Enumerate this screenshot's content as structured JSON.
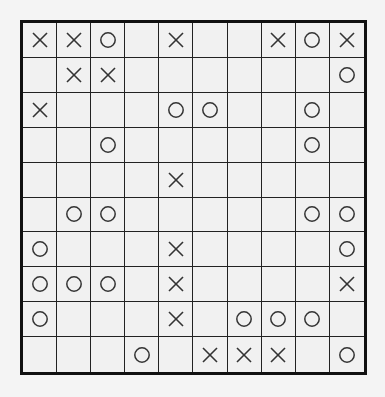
{
  "puzzle": {
    "rows": 10,
    "cols": 10,
    "colors": {
      "background": "#f4f4f4",
      "cell": "#f1f1f1",
      "line": "#222222",
      "border": "#111111",
      "mark": "#333333"
    },
    "grid": [
      [
        "X",
        "X",
        "O",
        "",
        "X",
        "",
        "",
        "X",
        "O",
        "X"
      ],
      [
        "",
        "X",
        "X",
        "",
        "",
        "",
        "",
        "",
        "",
        "O"
      ],
      [
        "X",
        "",
        "",
        "",
        "O",
        "O",
        "",
        "",
        "O",
        ""
      ],
      [
        "",
        "",
        "O",
        "",
        "",
        "",
        "",
        "",
        "O",
        ""
      ],
      [
        "",
        "",
        "",
        "",
        "X",
        "",
        "",
        "",
        "",
        ""
      ],
      [
        "",
        "O",
        "O",
        "",
        "",
        "",
        "",
        "",
        "O",
        "O"
      ],
      [
        "O",
        "",
        "",
        "",
        "X",
        "",
        "",
        "",
        "",
        "O"
      ],
      [
        "O",
        "O",
        "O",
        "",
        "X",
        "",
        "",
        "",
        "",
        "X"
      ],
      [
        "O",
        "",
        "",
        "",
        "X",
        "",
        "O",
        "O",
        "O",
        ""
      ],
      [
        "",
        "",
        "",
        "O",
        "",
        "X",
        "X",
        "X",
        "",
        "O"
      ]
    ],
    "legend": {
      "X": "cross-icon",
      "O": "circle-icon"
    }
  }
}
